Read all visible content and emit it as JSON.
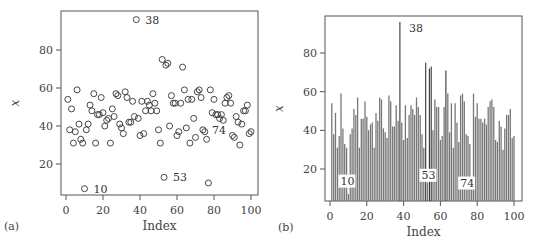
{
  "chart_data": [
    {
      "panel": "(a)",
      "type": "scatter",
      "title": "",
      "xlabel": "Index",
      "ylabel": "x",
      "xlim": [
        0,
        103
      ],
      "ylim": [
        4,
        100
      ],
      "xticks": [
        0,
        20,
        40,
        60,
        80,
        100
      ],
      "yticks": [
        20,
        40,
        60,
        80
      ],
      "grid": false,
      "marker": "open-circle",
      "annotations": [
        {
          "index": 38,
          "label": "38"
        },
        {
          "index": 10,
          "label": "10"
        },
        {
          "index": 53,
          "label": "53"
        },
        {
          "index": 74,
          "label": "74"
        }
      ]
    },
    {
      "panel": "(b)",
      "type": "bar",
      "title": "",
      "xlabel": "Index",
      "ylabel": "x",
      "xlim": [
        0,
        103
      ],
      "ylim": [
        4,
        100
      ],
      "xticks": [
        0,
        20,
        40,
        60,
        80,
        100
      ],
      "yticks": [
        20,
        40,
        60,
        80
      ],
      "grid": false,
      "style": "vertical lines (histogram-like, type='h')",
      "annotations": [
        {
          "index": 38,
          "label": "38"
        },
        {
          "index": 10,
          "label": "10"
        },
        {
          "index": 53,
          "label": "53"
        },
        {
          "index": 74,
          "label": "74"
        }
      ]
    }
  ],
  "series": {
    "name": "x",
    "x": [
      1,
      2,
      3,
      4,
      5,
      6,
      7,
      8,
      9,
      10,
      11,
      12,
      13,
      14,
      15,
      16,
      17,
      18,
      19,
      20,
      21,
      22,
      23,
      24,
      25,
      26,
      27,
      28,
      29,
      30,
      31,
      32,
      33,
      34,
      35,
      36,
      37,
      38,
      39,
      40,
      41,
      42,
      43,
      44,
      45,
      46,
      47,
      48,
      49,
      50,
      51,
      52,
      53,
      54,
      55,
      56,
      57,
      58,
      59,
      60,
      61,
      62,
      63,
      64,
      65,
      66,
      67,
      68,
      69,
      70,
      71,
      72,
      73,
      74,
      75,
      76,
      77,
      78,
      79,
      80,
      81,
      82,
      83,
      84,
      85,
      86,
      87,
      88,
      89,
      90,
      91,
      92,
      93,
      94,
      95,
      96,
      97,
      98,
      99,
      100
    ],
    "values": [
      54,
      38,
      49,
      31,
      37,
      59,
      41,
      33,
      31,
      7,
      38,
      41,
      51,
      48,
      57,
      31,
      46,
      46,
      55,
      47,
      40,
      43,
      44,
      31,
      49,
      45,
      57,
      56,
      41,
      39,
      36,
      58,
      55,
      42,
      42,
      53,
      45,
      96,
      44,
      35,
      53,
      36,
      48,
      53,
      51,
      48,
      57,
      52,
      48,
      38,
      31,
      75,
      13,
      72,
      73,
      40,
      56,
      52,
      52,
      35,
      37,
      52,
      71,
      59,
      39,
      54,
      31,
      54,
      44,
      34,
      58,
      59,
      55,
      38,
      37,
      33,
      10,
      59,
      47,
      54,
      46,
      46,
      44,
      46,
      43,
      52,
      55,
      56,
      52,
      35,
      34,
      45,
      42,
      30,
      41,
      48,
      48,
      51,
      36,
      37
    ]
  },
  "panels": {
    "a": {
      "label": "(a)",
      "xlabel": "Index",
      "ylabel": "x"
    },
    "b": {
      "label": "(b)",
      "xlabel": "Index",
      "ylabel": "x"
    }
  },
  "ticks": {
    "x": [
      "0",
      "20",
      "40",
      "60",
      "80",
      "100"
    ],
    "y": [
      "20",
      "40",
      "60",
      "80"
    ]
  },
  "annotations": [
    "38",
    "10",
    "53",
    "74"
  ],
  "colors": {
    "axis": "#555555",
    "marker": "#333333",
    "bar": "#777777",
    "bar_dark": "#333333"
  }
}
